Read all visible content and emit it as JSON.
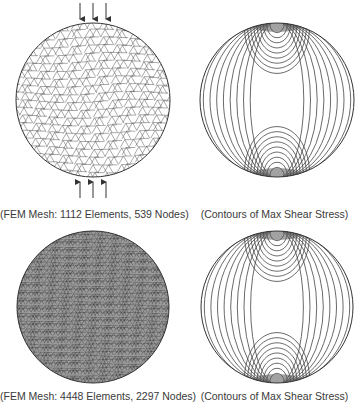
{
  "figure": {
    "panels": [
      {
        "id": "mesh-coarse",
        "kind": "fem-mesh",
        "caption": "(FEM Mesh: 1112 Elements, 539 Nodes)",
        "elements": 1112,
        "nodes": 539
      },
      {
        "id": "contours-coarse",
        "kind": "contour-plot",
        "caption": "(Contours of Max Shear Stress)"
      },
      {
        "id": "mesh-fine",
        "kind": "fem-mesh",
        "caption": "(FEM Mesh: 4448 Elements, 2297 Nodes)",
        "elements": 4448,
        "nodes": 2297
      },
      {
        "id": "contours-fine",
        "kind": "contour-plot",
        "caption": "(Contours of Max Shear Stress)"
      }
    ],
    "load_arrows": {
      "top": 3,
      "bottom": 3,
      "direction": "compressive"
    },
    "truncated_text": "· · ·"
  },
  "colors": {
    "line": "#333333",
    "background": "#ffffff",
    "caption": "#3a3a3a"
  }
}
